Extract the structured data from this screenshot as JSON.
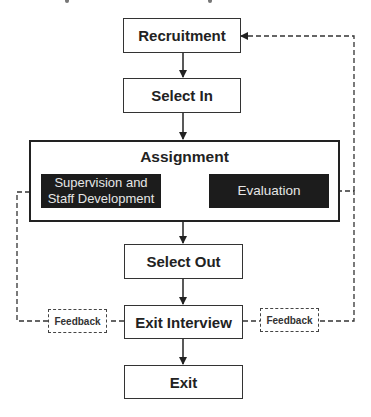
{
  "diagram": {
    "type": "flowchart",
    "nodes": {
      "recruitment": "Recruitment",
      "select_in": "Select In",
      "assignment": {
        "title": "Assignment",
        "supervision_line1": "Supervision and",
        "supervision_line2": "Staff Development",
        "evaluation": "Evaluation"
      },
      "select_out": "Select Out",
      "exit_interview": "Exit Interview",
      "exit": "Exit"
    },
    "feedback_left": "Feedback",
    "feedback_right": "Feedback",
    "edges": [
      {
        "from": "Recruitment",
        "to": "Select In",
        "style": "solid"
      },
      {
        "from": "Select In",
        "to": "Assignment",
        "style": "solid"
      },
      {
        "from": "Supervision and Staff Development",
        "to": "Evaluation",
        "style": "solid"
      },
      {
        "from": "Evaluation",
        "to": "Supervision and Staff Development",
        "style": "solid"
      },
      {
        "from": "Assignment",
        "to": "Select Out",
        "style": "solid"
      },
      {
        "from": "Select Out",
        "to": "Exit Interview",
        "style": "solid"
      },
      {
        "from": "Exit Interview",
        "to": "Exit",
        "style": "solid"
      },
      {
        "from": "Exit Interview",
        "to": "Supervision and Staff Development",
        "via": "Feedback",
        "style": "dashed"
      },
      {
        "from": "Exit Interview",
        "to": "Evaluation",
        "via": "Feedback",
        "style": "dashed"
      },
      {
        "from": "Exit Interview",
        "to": "Recruitment",
        "via": "Feedback",
        "style": "dashed"
      }
    ]
  }
}
